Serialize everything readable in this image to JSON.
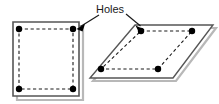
{
  "figure": {
    "title": "Holes",
    "annotation": {
      "label": "Holes",
      "label_x": 110,
      "label_y": 13,
      "arrows": [
        {
          "name": "arrow-to-square-hole",
          "from_x": 99,
          "from_y": 15,
          "to_x": 78,
          "to_y": 28
        },
        {
          "name": "arrow-to-parallelogram-hole",
          "from_x": 126,
          "from_y": 14,
          "to_x": 143,
          "to_y": 28
        }
      ]
    },
    "colors": {
      "outline": "#4d4d4d",
      "shadow": "#b3b3b3",
      "hole": "#000000",
      "dashed": "#1a1a1a",
      "background": "#ffffff",
      "text": "#1a1a1a"
    },
    "shapes": [
      {
        "name": "square-plate",
        "kind": "square",
        "outline_points": "13,22 79,22 79,96 13,96",
        "shadow_points": "17,26 83,26 83,100 17,100",
        "holes": [
          {
            "cx": 19,
            "cy": 29,
            "r": 3.2
          },
          {
            "cx": 73,
            "cy": 29,
            "r": 3.2
          },
          {
            "cx": 19,
            "cy": 89,
            "r": 3.2
          },
          {
            "cx": 73,
            "cy": 89,
            "r": 3.2
          }
        ],
        "hole_pattern_points": "19,29 73,29 73,89 19,89"
      },
      {
        "name": "parallelogram-plate",
        "kind": "parallelogram",
        "outline_points": "135,25 213,25 173,78 90,78",
        "shadow_points": "138,28 216,28 176,81 93,81",
        "holes": [
          {
            "cx": 141,
            "cy": 31,
            "r": 3.2
          },
          {
            "cx": 192,
            "cy": 31,
            "r": 3.2
          },
          {
            "cx": 101,
            "cy": 69,
            "r": 3.2
          },
          {
            "cx": 158,
            "cy": 69,
            "r": 3.2
          }
        ],
        "hole_pattern_points": "141,31 192,31 158,69 101,69"
      }
    ]
  }
}
